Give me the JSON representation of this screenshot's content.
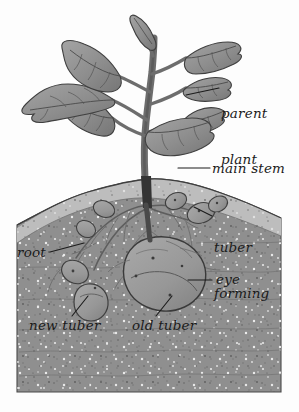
{
  "figure": {
    "style": "grayscale pencil-and-wash botanical illustration",
    "background_color": "#ffffff"
  },
  "colors": {
    "background": "#ffffff",
    "topsoil": "#b9b9b9",
    "subsoil": "#8f8f8f",
    "soil_shadow": "#7e7e7e",
    "soil_speck_light": "#e8e8e8",
    "soil_speck_dark": "#5d5d5d",
    "leaf_fill": "#8d8d8d",
    "leaf_shade": "#787878",
    "leaf_highlight": "#a6a6a6",
    "stem": "#6a6a6a",
    "stem_dark": "#3f3f3f",
    "tuber_fill": "#9b9b9b",
    "tuber_shade": "#868686",
    "outline": "#3a3a3a",
    "label_text": "#1b1b1b",
    "leader_line": "#1b1b1b"
  },
  "labels": [
    {
      "id": "parent-plant",
      "text_line1": "parent",
      "text_line2": "plant",
      "x": 223,
      "y": 84
    },
    {
      "id": "main-stem",
      "text_line1": "main stem",
      "text_line2": "",
      "x": 213,
      "y": 164
    },
    {
      "id": "tuber-forming",
      "text_line1": "tuber",
      "text_line2": "forming",
      "x": 215,
      "y": 218
    },
    {
      "id": "root",
      "text_line1": "root",
      "text_line2": "",
      "x": 18,
      "y": 252
    },
    {
      "id": "eye",
      "text_line1": "eye",
      "text_line2": "",
      "x": 215,
      "y": 276
    },
    {
      "id": "new-tuber",
      "text_line1": "new tuber",
      "text_line2": "",
      "x": 30,
      "y": 322
    },
    {
      "id": "old-tuber",
      "text_line1": "old tuber",
      "text_line2": "",
      "x": 133,
      "y": 322
    }
  ],
  "parts": {
    "parent_plant": "parent plant",
    "main_stem": "main stem",
    "tuber_forming": "tuber forming",
    "root": "root",
    "eye": "eye",
    "new_tuber": "new tuber",
    "old_tuber": "old tuber"
  },
  "counts": {
    "leaves": 7,
    "new_tubers": 3,
    "forming_tubers": 3,
    "old_tubers": 1
  }
}
